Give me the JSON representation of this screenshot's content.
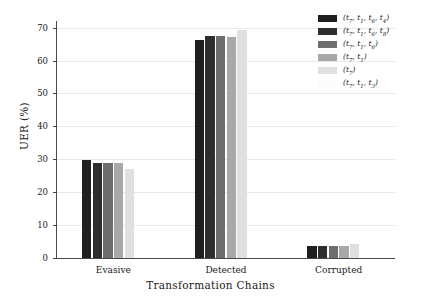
{
  "chart_data": {
    "type": "bar",
    "title": "",
    "xlabel": "Transformation Chains",
    "ylabel": "UER (%)",
    "categories": [
      "Evasive",
      "Detected",
      "Corrupted"
    ],
    "ylim": [
      0,
      72
    ],
    "yticks": [
      0,
      10,
      20,
      30,
      40,
      50,
      60,
      70
    ],
    "grid": true,
    "legend_position": "upper right",
    "series": [
      {
        "name": "(t7, t1, t6, t4)",
        "color": "#1f1f1f",
        "values": [
          29.8,
          66.3,
          3.6
        ]
      },
      {
        "name": "(t7, t1, t6, t8)",
        "color": "#2e2e2e",
        "values": [
          28.9,
          67.5,
          3.7
        ]
      },
      {
        "name": "(t7, t1, t6)",
        "color": "#6e6e6e",
        "values": [
          28.8,
          67.3,
          3.6
        ]
      },
      {
        "name": "(t7, t1)",
        "color": "#a8a8a8",
        "values": [
          28.8,
          67.2,
          3.5
        ]
      },
      {
        "name": "(t7)",
        "color": "#e0e0e0",
        "values": [
          26.9,
          69.4,
          4.4
        ]
      },
      {
        "name": "(t7, t1, t3)",
        "color": "#fcfcfc",
        "values": [
          0.0,
          0.0,
          0.0
        ]
      }
    ]
  },
  "legend": {
    "entries": [
      {
        "label_html": "(t<sub>7</sub>, t<sub>1</sub>, t<sub>6</sub>, t<sub>4</sub>)"
      },
      {
        "label_html": "(t<sub>7</sub>, t<sub>1</sub>, t<sub>6</sub>, t<sub>8</sub>)"
      },
      {
        "label_html": "(t<sub>7</sub>, t<sub>1</sub>, t<sub>6</sub>)"
      },
      {
        "label_html": "(t<sub>7</sub>, t<sub>1</sub>)"
      },
      {
        "label_html": "(t<sub>7</sub>)"
      },
      {
        "label_html": "(t<sub>7</sub>, t<sub>1</sub>, t<sub>3</sub>)"
      }
    ]
  },
  "axes": {
    "ytick_labels": [
      "0",
      "10",
      "20",
      "30",
      "40",
      "50",
      "60",
      "70"
    ],
    "xtick_labels": [
      "Evasive",
      "Detected",
      "Corrupted"
    ],
    "y_title": "UER (%)",
    "x_title": "Transformation Chains"
  },
  "colors": {
    "axis": "#4a4a4a",
    "grid": "#e8e8e8",
    "text": "#1a1a1a",
    "background": "#ffffff"
  }
}
